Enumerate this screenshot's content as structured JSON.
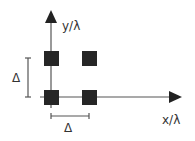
{
  "diagram": {
    "axes": {
      "x_label": "x/λ",
      "y_label": "y/λ"
    },
    "spacing_labels": {
      "horizontal": "Δ",
      "vertical": "Δ"
    },
    "elements": [
      {
        "name": "element-bottom-left",
        "grid": [
          0,
          0
        ]
      },
      {
        "name": "element-bottom-right",
        "grid": [
          1,
          0
        ]
      },
      {
        "name": "element-top-left",
        "grid": [
          0,
          1
        ]
      },
      {
        "name": "element-top-right",
        "grid": [
          1,
          1
        ]
      }
    ],
    "colors": {
      "element": "#262626",
      "axis": "#555555"
    }
  }
}
